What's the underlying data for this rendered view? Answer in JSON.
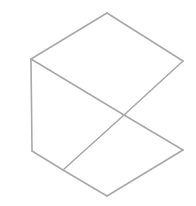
{
  "figure": {
    "stroke_color": "#a9a9a9",
    "background": "#ffffff",
    "vertices": {
      "top": [
        107,
        13
      ],
      "upper_left": [
        31,
        59
      ],
      "upper_right": [
        183,
        61
      ],
      "center": [
        124,
        115
      ],
      "lower_right": [
        183,
        150
      ],
      "lower_left": [
        32,
        151
      ],
      "junction": [
        63,
        170
      ],
      "bottom": [
        107,
        196
      ]
    },
    "edges": [
      [
        "top",
        "upper_left"
      ],
      [
        "top",
        "upper_right"
      ],
      [
        "upper_left",
        "lower_left"
      ],
      [
        "upper_left",
        "center"
      ],
      [
        "center",
        "lower_right"
      ],
      [
        "upper_right",
        "center"
      ],
      [
        "center",
        "junction"
      ],
      [
        "lower_left",
        "junction"
      ],
      [
        "junction",
        "bottom"
      ],
      [
        "bottom",
        "lower_right"
      ]
    ]
  }
}
